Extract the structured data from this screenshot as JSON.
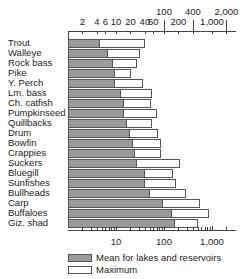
{
  "chart_data": {
    "type": "bar",
    "orientation": "horizontal",
    "scale": "log",
    "title": "",
    "xlabel": "",
    "ylabel": "",
    "xlim": [
      1,
      3000
    ],
    "categories": [
      "Trout",
      "Walleye",
      "Rock bass",
      "Pike",
      "Y. Perch",
      "Lm. bass",
      "Ch. catfish",
      "Pumpkinseed",
      "Quillbacks",
      "Drum",
      "Bowfin",
      "Crappies",
      "Suckers",
      "Bluegill",
      "Sunfishes",
      "Bullheads",
      "Carp",
      "Buffaloes",
      "Giz. shad"
    ],
    "series": [
      {
        "name": "Mean for lakes and reservoirs",
        "color": "#9a9a9a",
        "values": [
          4.6,
          6.8,
          8.7,
          9.5,
          9.5,
          13,
          15,
          15,
          17,
          20,
          23,
          25,
          27,
          40,
          40,
          51,
          95,
          147,
          169
        ]
      },
      {
        "name": "Maximum",
        "color": "#ffffff",
        "values": [
          40,
          32,
          27,
          21,
          36,
          56,
          54,
          71,
          56,
          75,
          87,
          87,
          215,
          154,
          178,
          287,
          562,
          866,
          510
        ]
      }
    ],
    "top_axis": {
      "row1_ticks": [
        "2",
        "4",
        "6",
        "10",
        "20",
        "40",
        "60",
        "200",
        "1,000"
      ],
      "row1_values": [
        2,
        4,
        6,
        10,
        20,
        40,
        60,
        200,
        1000
      ],
      "row2_ticks": [
        "100",
        "400",
        "2,000"
      ],
      "row2_values": [
        100,
        400,
        2000
      ]
    },
    "bottom_axis": {
      "ticks": [
        "10",
        "100",
        "1,000"
      ],
      "values": [
        10,
        100,
        1000
      ]
    },
    "legend": {
      "position": "bottom",
      "entries": [
        "Mean for lakes and reservoirs",
        "Maximum"
      ]
    },
    "grid": false
  }
}
